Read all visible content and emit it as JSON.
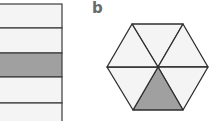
{
  "figure_a": {
    "type": "rectangle-fraction",
    "bands": [
      {
        "y": 4,
        "h": 24,
        "shaded": false
      },
      {
        "y": 28,
        "h": 25,
        "shaded": false
      },
      {
        "y": 53,
        "h": 24,
        "shaded": true
      },
      {
        "y": 77,
        "h": 26,
        "shaded": false
      },
      {
        "y": 103,
        "h": 20,
        "shaded": false
      }
    ],
    "right_edge_x": 62
  },
  "figure_b": {
    "label": "b",
    "type": "hexagon-fraction",
    "total_parts": 6,
    "shaded_parts": 1,
    "shaded_position": "bottom"
  },
  "colors": {
    "stroke": "#3a3a3a",
    "fill_light": "#f4f4f4",
    "fill_shaded": "#a0a0a0",
    "label": "#6a6a6a"
  }
}
